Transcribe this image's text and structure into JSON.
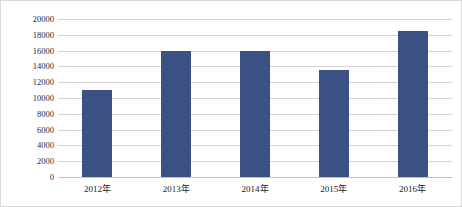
{
  "chart_data": {
    "type": "bar",
    "title": "",
    "subtitle": "",
    "xlabel": "",
    "ylabel": "收费站年平均日交通量(辆/日)",
    "categories": [
      "2012年",
      "2013年",
      "2014年",
      "2015年",
      "2016年"
    ],
    "values": [
      11000,
      16000,
      16000,
      13500,
      18500
    ],
    "series": [
      {
        "name": "收费站年平均日交通量",
        "values": [
          11000,
          16000,
          16000,
          13500,
          18500
        ]
      }
    ],
    "ylim": [
      0,
      20000
    ],
    "ytick_step": 2000,
    "ytick_labels": [
      "0",
      "2000",
      "4000",
      "6000",
      "8000",
      "10000",
      "12000",
      "14000",
      "16000",
      "18000",
      "20000"
    ],
    "ytick_values": [
      0,
      2000,
      4000,
      6000,
      8000,
      10000,
      12000,
      14000,
      16000,
      18000,
      20000
    ],
    "grid": true,
    "grid_axis": "y",
    "legend": false,
    "legend_position": "none",
    "bar_color": "#3c5183",
    "grid_color": "#d6d6d6",
    "background_color": "#ffffff",
    "border_color": "#d9d9d9",
    "text_color": "#1a1a1a"
  }
}
